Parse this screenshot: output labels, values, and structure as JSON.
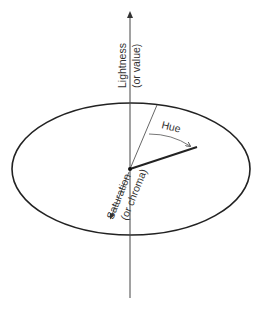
{
  "diagram": {
    "labels": {
      "lightness_line1": "Lightness",
      "lightness_line2": "(or value)",
      "hue": "Hue",
      "saturation_line1": "Saturation",
      "saturation_line2": "(or chroma)"
    },
    "colors": {
      "stroke": "#222222",
      "thin_stroke": "#555555",
      "background": "#ffffff"
    }
  }
}
